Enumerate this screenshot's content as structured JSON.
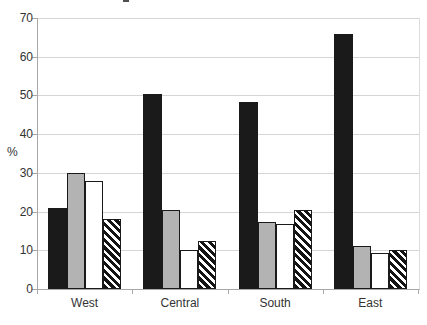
{
  "chart_data": {
    "type": "bar",
    "title": "",
    "ylabel": "%",
    "xlabel": "",
    "categories": [
      "West",
      "Central",
      "South",
      "East"
    ],
    "series": [
      {
        "name": "black-solid",
        "style": "solid-black",
        "values": [
          21,
          50.5,
          48.2,
          66
        ]
      },
      {
        "name": "gray-solid",
        "style": "solid-gray",
        "values": [
          30,
          20.3,
          17.3,
          11
        ]
      },
      {
        "name": "white-outline",
        "style": "solid-white",
        "values": [
          28,
          10.2,
          16.8,
          9.3
        ]
      },
      {
        "name": "diagonal-hatch",
        "style": "hatch",
        "values": [
          18,
          12.4,
          20.3,
          10.2
        ]
      }
    ],
    "ylim": [
      0,
      70
    ],
    "yticks": [
      0,
      10,
      20,
      30,
      40,
      50,
      60,
      70
    ],
    "grid": true,
    "legend": "none"
  },
  "colors": {
    "background": "#ffffff",
    "bar_black": "#1a1a1a",
    "bar_gray": "#b3b3b3",
    "bar_white": "#ffffff",
    "bar_border": "#1a1a1a",
    "hatch_stripe": "#141414",
    "gridline": "#d5d5d5",
    "axis": "#a8a8a8",
    "text": "#333333"
  }
}
